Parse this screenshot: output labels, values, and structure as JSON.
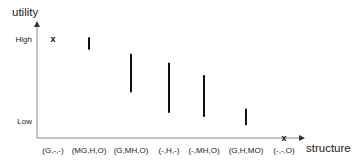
{
  "chart_data": {
    "type": "bar",
    "subtype": "floating-range",
    "title": "",
    "xlabel": "structure",
    "ylabel": "utility",
    "categories": [
      "(G,-,-)",
      "(MG,H,O)",
      "(G,MH,O)",
      "(-,H,-)",
      "(-,MH,O)",
      "(G,H,MO)",
      "(-,-,O)"
    ],
    "y_ticks": [
      {
        "label": "High",
        "value": 1.0
      },
      {
        "label": "Low",
        "value": 0.0
      }
    ],
    "ylim": [
      -0.21,
      1.21
    ],
    "grid": false,
    "legend": "none",
    "series": [
      {
        "name": "utility range",
        "style": "vertical-bar",
        "ranges": [
          null,
          [
            0.87,
            1.02
          ],
          [
            0.35,
            0.82
          ],
          [
            0.1,
            0.71
          ],
          [
            0.05,
            0.56
          ],
          [
            -0.05,
            0.15
          ],
          null
        ]
      },
      {
        "name": "point utility",
        "style": "x-marker",
        "marker_symbol": "x",
        "values": [
          1.0,
          null,
          null,
          null,
          null,
          null,
          -0.21
        ]
      }
    ],
    "colors": {
      "axis": "#888888",
      "bars": "#111111",
      "text": "#222222"
    }
  }
}
